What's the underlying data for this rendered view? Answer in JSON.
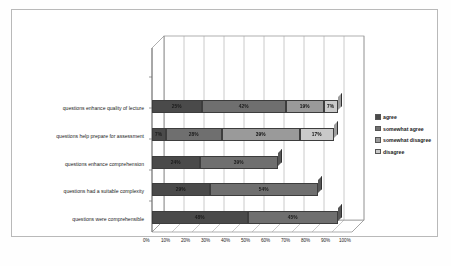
{
  "chart_data": {
    "type": "bar",
    "orientation": "horizontal",
    "stacked": true,
    "title": "",
    "subtitle": "",
    "xlabel": "",
    "ylabel": "",
    "xlim": [
      0,
      100
    ],
    "xtick_labels": [
      "0%",
      "10%",
      "20%",
      "30%",
      "40%",
      "50%",
      "60%",
      "70%",
      "80%",
      "90%",
      "100%"
    ],
    "xtick_values": [
      0,
      10,
      20,
      30,
      40,
      50,
      60,
      70,
      80,
      90,
      100
    ],
    "grid": true,
    "grid_axis": "x",
    "legend_position": "right",
    "categories": [
      "questions enhance quality of lecture",
      "questions help prepare for assessment",
      "questions enhance comprehension",
      "questions had a suitable complexity",
      "questions were comprehensible"
    ],
    "series": [
      {
        "name": "agree",
        "color": "#4a4a4a",
        "values": [
          25,
          7,
          24,
          29,
          48
        ],
        "labels": [
          "25%",
          "7%",
          "24%",
          "29%",
          "48%"
        ]
      },
      {
        "name": "somewhat agree",
        "color": "#6f6f6f",
        "values": [
          42,
          28,
          39,
          54,
          45
        ],
        "labels": [
          "42%",
          "28%",
          "39%",
          "54%",
          "45%"
        ]
      },
      {
        "name": "somewhat disagree",
        "color": "#9a9a9a",
        "values": [
          19,
          39,
          0,
          0,
          0
        ],
        "labels": [
          "19%",
          "39%",
          "",
          "",
          ""
        ]
      },
      {
        "name": "disagree",
        "color": "#c9c9c9",
        "values": [
          7,
          17,
          0,
          0,
          0
        ],
        "labels": [
          "7%",
          "17%",
          "",
          "",
          ""
        ]
      }
    ],
    "legend_entries": [
      "agree",
      "somewhat agree",
      "somewhat disagree",
      "disagree"
    ]
  }
}
